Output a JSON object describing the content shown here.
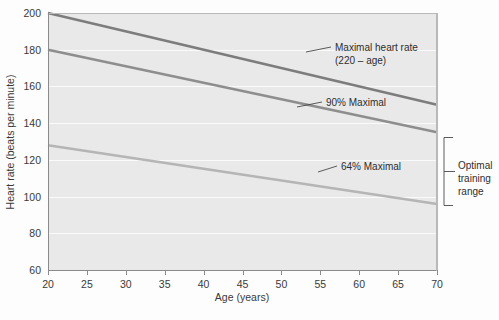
{
  "chart_data": {
    "type": "line",
    "title": "",
    "xlabel": "Age (years)",
    "ylabel": "Heart rate (beats per minute)",
    "xlim": [
      20,
      70
    ],
    "ylim": [
      60,
      200
    ],
    "xticks": [
      20,
      25,
      30,
      35,
      40,
      45,
      50,
      55,
      60,
      65,
      70
    ],
    "yticks": [
      60,
      80,
      100,
      120,
      140,
      160,
      180,
      200
    ],
    "grid": "horizontal",
    "legend_position": "inline-annotations",
    "series": [
      {
        "name": "Maximal heart rate (220 - age)",
        "color": "#7d7d7d",
        "x": [
          20,
          70
        ],
        "values": [
          200,
          150
        ]
      },
      {
        "name": "90% Maximal",
        "color": "#8e8e8e",
        "x": [
          20,
          70
        ],
        "values": [
          180,
          135
        ]
      },
      {
        "name": "64% Maximal",
        "color": "#b5b5b5",
        "x": [
          20,
          70
        ],
        "values": [
          128,
          96
        ]
      }
    ],
    "annotations": [
      {
        "id": "maximal",
        "line1": "Maximal heart rate",
        "line2": "(220 – age)"
      },
      {
        "id": "ninety",
        "line1": "90% Maximal",
        "line2": ""
      },
      {
        "id": "sixtyfour",
        "line1": "64% Maximal",
        "line2": ""
      }
    ],
    "bracket": {
      "label_lines": [
        "Optimal",
        "training",
        "range"
      ],
      "from_value": 135,
      "to_value": 96
    },
    "colors": {
      "plot_background": "#e9e9e9",
      "gridline": "#fafafa",
      "axis": "#8a8a8a",
      "page_background": "#fdfdfd",
      "text": "#3a3a3a"
    }
  }
}
